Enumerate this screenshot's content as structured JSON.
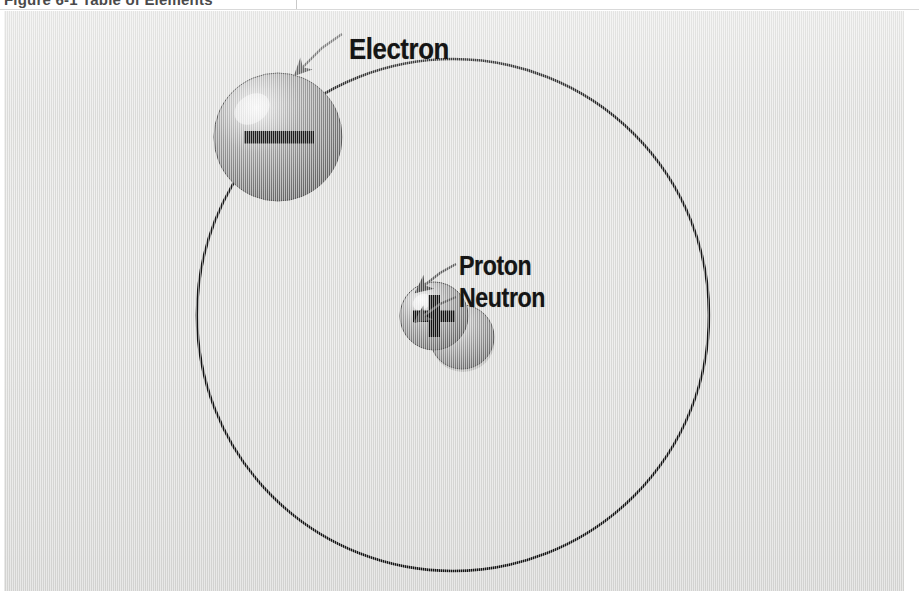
{
  "page": {
    "caption": "Figure 6-1 Table of Elements",
    "background_color": "#ffffff"
  },
  "figure": {
    "panel_color": "#dededc",
    "line_color": "#101010",
    "labels": {
      "electron": "Electron",
      "proton": "Proton",
      "neutron": "Neutron"
    },
    "symbols": {
      "electron_charge": "minus",
      "proton_charge": "plus",
      "neutron_charge": "none"
    },
    "geometry": {
      "orbit_center_x": 449,
      "orbit_center_y": 304,
      "orbit_radius": 256,
      "electron_center_x": 274,
      "electron_center_y": 126,
      "electron_radius": 64,
      "proton_center_x": 430,
      "proton_center_y": 305,
      "proton_radius": 34,
      "neutron_center_x": 458,
      "neutron_center_y": 326,
      "neutron_radius": 32
    }
  }
}
